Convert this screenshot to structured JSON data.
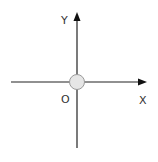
{
  "diagram": {
    "type": "coordinate-axes",
    "labels": {
      "y_axis": "Y",
      "x_axis": "X",
      "origin": "O"
    },
    "colors": {
      "axis": "#222222",
      "origin_fill": "#e6e6e6",
      "origin_stroke": "#999999",
      "label": "#333333"
    }
  }
}
